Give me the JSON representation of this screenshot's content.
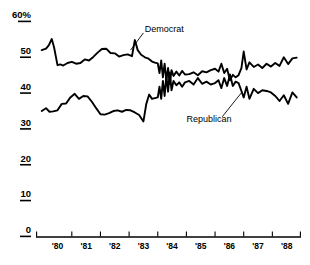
{
  "chart_data": {
    "type": "line",
    "title": "",
    "subtitle": "",
    "xlabel": "",
    "ylabel": "",
    "ylim": [
      0,
      60
    ],
    "xlim": [
      1979.75,
      1989.0
    ],
    "grid": false,
    "legend_position": "inline-annotation",
    "y_ticks": [
      {
        "value": 60,
        "label": "60%"
      },
      {
        "value": 50,
        "label": "50"
      },
      {
        "value": 40,
        "label": "40"
      },
      {
        "value": 30,
        "label": "30"
      },
      {
        "value": 20,
        "label": "20"
      },
      {
        "value": 10,
        "label": "10"
      },
      {
        "value": 0,
        "label": "0"
      }
    ],
    "x_ticks": [
      {
        "value": 1980.0,
        "label": "'80"
      },
      {
        "value": 1981.0,
        "label": "'81"
      },
      {
        "value": 1982.0,
        "label": "'82"
      },
      {
        "value": 1983.0,
        "label": "'83"
      },
      {
        "value": 1984.0,
        "label": "'84"
      },
      {
        "value": 1985.0,
        "label": "'85"
      },
      {
        "value": 1986.0,
        "label": "'86"
      },
      {
        "value": 1987.0,
        "label": "'87"
      },
      {
        "value": 1988.0,
        "label": "'88"
      }
    ],
    "annotations": [
      {
        "name": "democrat-annotation",
        "text": "Democrat",
        "text_x": 1983.55,
        "text_y": 56.2,
        "leader_from": [
          1983.5,
          55.0
        ],
        "leader_to": [
          1983.05,
          50.2
        ]
      },
      {
        "name": "republican-annotation",
        "text": "Republican",
        "text_x": 1985.0,
        "text_y": 31.0,
        "leader_from": [
          1986.25,
          31.6
        ],
        "leader_to": [
          1986.95,
          38.6
        ]
      }
    ],
    "series": [
      {
        "name": "Democrat",
        "color": "#000000",
        "x": [
          1979.95,
          1980.1,
          1980.2,
          1980.3,
          1980.38,
          1980.5,
          1980.6,
          1980.7,
          1980.85,
          1981.0,
          1981.15,
          1981.3,
          1981.45,
          1981.6,
          1981.75,
          1981.9,
          1982.05,
          1982.2,
          1982.35,
          1982.5,
          1982.65,
          1982.8,
          1982.95,
          1983.1,
          1983.2,
          1983.3,
          1983.42,
          1983.55,
          1983.68,
          1983.8,
          1983.9,
          1984.0,
          1984.06,
          1984.12,
          1984.18,
          1984.24,
          1984.3,
          1984.36,
          1984.42,
          1984.48,
          1984.55,
          1984.65,
          1984.75,
          1984.85,
          1984.95,
          1985.1,
          1985.25,
          1985.4,
          1985.55,
          1985.7,
          1985.85,
          1986.0,
          1986.12,
          1986.22,
          1986.32,
          1986.42,
          1986.52,
          1986.62,
          1986.72,
          1986.82,
          1986.92,
          1987.0,
          1987.1,
          1987.2,
          1987.35,
          1987.5,
          1987.65,
          1987.8,
          1987.95,
          1988.1,
          1988.25,
          1988.4,
          1988.55,
          1988.7,
          1988.85
        ],
        "y": [
          50.2,
          50.6,
          51.6,
          53.3,
          51.0,
          46.0,
          46.2,
          45.9,
          46.6,
          46.9,
          46.4,
          46.6,
          47.6,
          47.3,
          48.3,
          49.5,
          50.5,
          50.6,
          49.4,
          49.3,
          48.4,
          48.8,
          49.0,
          48.5,
          53.0,
          50.2,
          48.9,
          48.2,
          47.8,
          47.0,
          46.7,
          46.5,
          43.8,
          47.3,
          42.6,
          46.4,
          41.8,
          45.2,
          40.8,
          44.6,
          43.0,
          44.2,
          43.1,
          44.4,
          43.4,
          43.5,
          44.0,
          43.2,
          44.3,
          44.0,
          44.6,
          45.0,
          44.2,
          46.4,
          43.8,
          45.0,
          41.8,
          43.3,
          42.6,
          43.2,
          45.2,
          49.8,
          44.8,
          46.8,
          45.5,
          46.2,
          45.2,
          46.4,
          45.6,
          46.6,
          45.8,
          48.2,
          46.3,
          47.9,
          48.1
        ]
      },
      {
        "name": "Republican",
        "color": "#000000",
        "x": [
          1979.95,
          1980.1,
          1980.22,
          1980.35,
          1980.5,
          1980.65,
          1980.8,
          1980.95,
          1981.1,
          1981.25,
          1981.4,
          1981.55,
          1981.7,
          1981.85,
          1982.0,
          1982.15,
          1982.3,
          1982.45,
          1982.6,
          1982.75,
          1982.9,
          1983.05,
          1983.2,
          1983.35,
          1983.5,
          1983.6,
          1983.7,
          1983.8,
          1983.9,
          1984.0,
          1984.06,
          1984.12,
          1984.18,
          1984.24,
          1984.3,
          1984.36,
          1984.42,
          1984.48,
          1984.55,
          1984.65,
          1984.75,
          1984.85,
          1984.95,
          1985.1,
          1985.25,
          1985.4,
          1985.55,
          1985.7,
          1985.85,
          1986.0,
          1986.12,
          1986.22,
          1986.32,
          1986.42,
          1986.52,
          1986.62,
          1986.72,
          1986.82,
          1986.92,
          1987.0,
          1987.1,
          1987.2,
          1987.35,
          1987.5,
          1987.65,
          1987.8,
          1987.95,
          1988.1,
          1988.25,
          1988.4,
          1988.55,
          1988.7,
          1988.85
        ],
        "y": [
          33.2,
          34.0,
          33.0,
          33.1,
          33.4,
          35.2,
          35.3,
          37.0,
          38.0,
          36.6,
          37.4,
          37.3,
          35.8,
          34.0,
          32.3,
          32.2,
          32.6,
          33.2,
          33.4,
          33.0,
          33.5,
          33.4,
          32.8,
          32.1,
          30.3,
          35.2,
          37.8,
          36.6,
          36.8,
          37.0,
          40.0,
          36.6,
          41.6,
          37.4,
          43.0,
          38.6,
          44.0,
          39.0,
          41.6,
          40.4,
          41.2,
          40.0,
          41.2,
          41.6,
          40.6,
          42.4,
          40.8,
          41.4,
          40.6,
          41.0,
          41.8,
          39.6,
          42.4,
          40.2,
          43.4,
          40.2,
          41.4,
          41.0,
          38.8,
          37.0,
          40.0,
          36.6,
          39.4,
          38.2,
          39.0,
          38.8,
          38.4,
          37.4,
          36.0,
          37.6,
          35.2,
          38.4,
          37.0
        ]
      }
    ]
  }
}
